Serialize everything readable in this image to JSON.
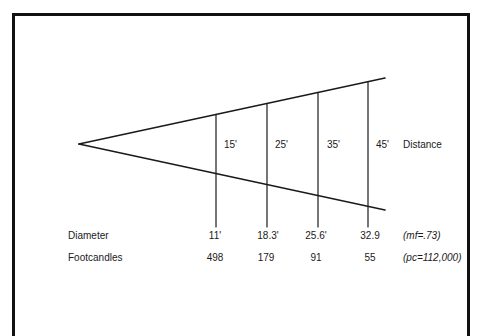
{
  "diagram": {
    "apex": {
      "x": 79,
      "y": 144
    },
    "beam_top_end": {
      "x": 385,
      "y": 78
    },
    "beam_bottom_end": {
      "x": 385,
      "y": 210
    },
    "line_color": "#1a1a1a",
    "distance_label": "Distance",
    "stations": [
      {
        "x": 216,
        "distance": "15'",
        "diameter": "11'",
        "footcandles": "498"
      },
      {
        "x": 267,
        "distance": "25'",
        "diameter": "18.3'",
        "footcandles": "179"
      },
      {
        "x": 318,
        "distance": "35'",
        "diameter": "25.6'",
        "footcandles": "91"
      },
      {
        "x": 368,
        "distance": "45'",
        "diameter": "32.9",
        "footcandles": "55"
      }
    ],
    "rows": {
      "diameter_label": "Diameter",
      "footcandles_label": "Footcandles",
      "diameter_note": "(mf=.73)",
      "footcandles_note": "(pc=112,000)"
    }
  }
}
